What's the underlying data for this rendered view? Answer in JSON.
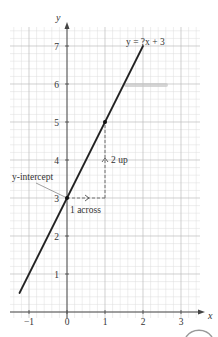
{
  "chart_data": {
    "type": "line",
    "title": "",
    "xlabel": "x",
    "ylabel": "y",
    "xlim": [
      -1.5,
      3.5
    ],
    "ylim": [
      0,
      7.5
    ],
    "xticks": [
      -1,
      0,
      1,
      2,
      3
    ],
    "yticks": [
      1,
      2,
      3,
      4,
      5,
      6,
      7
    ],
    "xtick_labels": [
      "−1",
      "0",
      "1",
      "2",
      "3"
    ],
    "ytick_labels": [
      "1",
      "2",
      "3",
      "4",
      "5",
      "6",
      "7"
    ],
    "grid": true,
    "grid_minor_divisions": 5,
    "series": [
      {
        "name": "y = 2x + 3",
        "equation_label": "y = ?x + 3",
        "x": [
          -1.25,
          2
        ],
        "y": [
          0.5,
          7
        ],
        "color": "#222222"
      }
    ],
    "points": [
      {
        "x": 0,
        "y": 3,
        "label": "y-intercept"
      },
      {
        "x": 1,
        "y": 5,
        "label": ""
      }
    ],
    "annotations": [
      {
        "text": "y-intercept",
        "points_to": [
          0,
          3
        ]
      },
      {
        "text": "1 across",
        "from": [
          0,
          3
        ],
        "to": [
          1,
          3
        ],
        "style": "dashed-arrow-right"
      },
      {
        "text": "2 up",
        "from": [
          1,
          3
        ],
        "to": [
          1,
          5
        ],
        "style": "dashed-arrow-up"
      }
    ],
    "legend": null
  },
  "labels": {
    "x_axis": "x",
    "y_axis": "y",
    "equation": "y = ?x + 3",
    "y_intercept": "y-intercept",
    "across": "1 across",
    "up": "2 up"
  },
  "colors": {
    "grid_minor": "#dddddd",
    "grid_major": "#bbbbbb",
    "axis": "#555555",
    "line": "#222222",
    "dashed": "#666666",
    "smudge": "#c8c8c8"
  }
}
